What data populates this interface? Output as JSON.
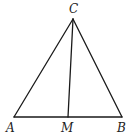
{
  "diagram": {
    "type": "triangle-with-cevian",
    "stroke_color": "#1a1a1a",
    "points": {
      "C": {
        "label": "C",
        "x": 73,
        "y": 19
      },
      "A": {
        "label": "A",
        "x": 14,
        "y": 117
      },
      "M": {
        "label": "M",
        "x": 68,
        "y": 117
      },
      "B": {
        "label": "B",
        "x": 122,
        "y": 117
      }
    },
    "segments": [
      {
        "from": "A",
        "to": "C"
      },
      {
        "from": "C",
        "to": "B"
      },
      {
        "from": "A",
        "to": "B"
      },
      {
        "from": "C",
        "to": "M"
      }
    ],
    "labels": {
      "C": "C",
      "A": "A",
      "M": "M",
      "B": "B"
    }
  }
}
